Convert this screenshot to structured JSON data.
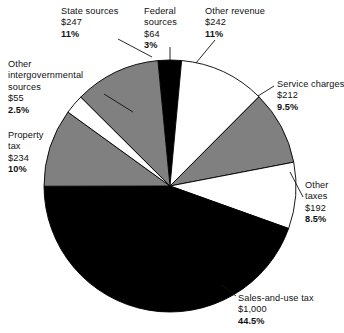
{
  "chart_data": {
    "type": "pie",
    "title": "",
    "subtitle": "",
    "xlabel": "",
    "ylabel": "",
    "legend_position": "none",
    "grid": false,
    "value_prefix": "$",
    "total_value": 2246,
    "slices": [
      {
        "id": "federal",
        "label": "Federal sources",
        "value": "$64",
        "percent": "3%",
        "pct_num": 3.0,
        "fill": "#000000",
        "exploded": false
      },
      {
        "id": "otherrev",
        "label": "Other revenue",
        "value": "$242",
        "percent": "11%",
        "pct_num": 11.0,
        "fill": "#ffffff",
        "exploded": false
      },
      {
        "id": "service",
        "label": "Service charges",
        "value": "$212",
        "percent": "9.5%",
        "pct_num": 9.5,
        "fill": "#808080",
        "exploded": false
      },
      {
        "id": "othertax",
        "label": "Other taxes",
        "value": "$192",
        "percent": "8.5%",
        "pct_num": 8.5,
        "fill": "#ffffff",
        "exploded": false
      },
      {
        "id": "sales",
        "label": "Sales-and-use tax",
        "value": "$1,000",
        "percent": "44.5%",
        "pct_num": 44.5,
        "fill": "#000000",
        "exploded": false
      },
      {
        "id": "property",
        "label": "Property tax",
        "value": "$234",
        "percent": "10%",
        "pct_num": 10.0,
        "fill": "#808080",
        "exploded": false
      },
      {
        "id": "interg",
        "label": "Other intergovernmental sources",
        "value": "$55",
        "percent": "2.5%",
        "pct_num": 2.5,
        "fill": "#ffffff",
        "exploded": false
      },
      {
        "id": "state",
        "label": "State sources",
        "value": "$247",
        "percent": "11%",
        "pct_num": 11.0,
        "fill": "#808080",
        "exploded": false
      }
    ],
    "colors": {
      "dark": "#000000",
      "mid": "#808080",
      "light": "#ffffff",
      "outline": "#000000",
      "background": "#ffffff",
      "text": "#111111"
    }
  },
  "labels": {
    "state": {
      "name": "State sources",
      "value": "$247",
      "percent": "11%"
    },
    "federal": {
      "name_line1": "Federal",
      "name_line2": "sources",
      "value": "$64",
      "percent": "3%"
    },
    "otherrev": {
      "name": "Other revenue",
      "value": "$242",
      "percent": "11%"
    },
    "service": {
      "name": "Service charges",
      "value": "$212",
      "percent": "9.5%"
    },
    "othertax": {
      "name_line1": "Other",
      "name_line2": "taxes",
      "value": "$192",
      "percent": "8.5%"
    },
    "sales": {
      "name": "Sales-and-use tax",
      "value": "$1,000",
      "percent": "44.5%"
    },
    "property": {
      "name_line1": "Property",
      "name_line2": "tax",
      "value": "$234",
      "percent": "10%"
    },
    "interg": {
      "name": "Other intergovernmental sources",
      "value": "$55",
      "percent": "2.5%"
    }
  }
}
